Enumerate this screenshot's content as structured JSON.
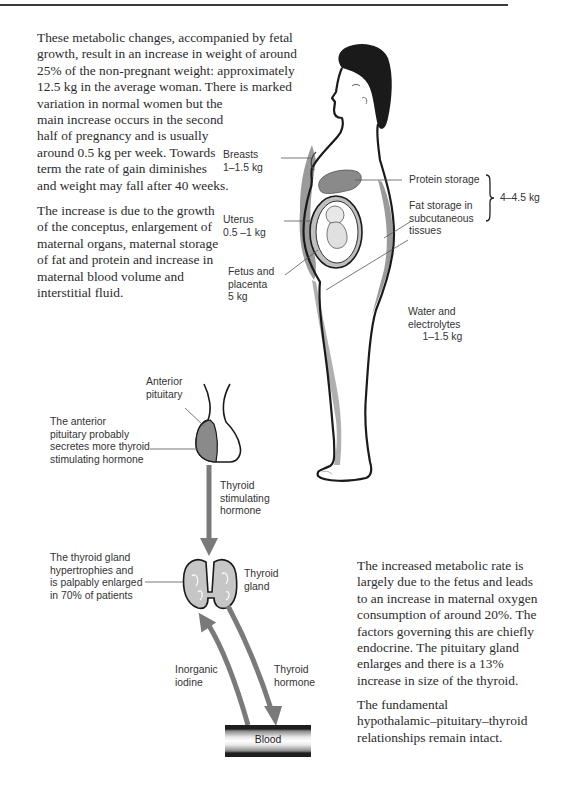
{
  "page": {
    "paragraphs": {
      "intro_1": "These metabolic changes, accompanied by fetal growth, result in an increase in weight of around 25% of the non-pregnant weight: approximately 12.5 kg in the average woman. There is marked variation in normal women but the main increase occurs in the second half of pregnancy and is usually around 0.5 kg per week. Towards term the rate of gain diminishes and weight may fall after 40 weeks.",
      "intro_2": "The increase is due to the growth of the conceptus, enlargement of maternal organs, maternal storage of fat and protein and increase in maternal blood volume and interstitial fluid.",
      "metabolic_1": "The increased metabolic rate is largely due to the fetus and leads to an increase in maternal oxygen consumption of around 20%. The factors governing this are chiefly endocrine. The pituitary gland enlarges and there is a 13% increase in size of the thyroid.",
      "metabolic_2": "The fundamental hypothalamic–pituitary–thyroid relationships remain intact."
    },
    "intro_1_lines": [
      "These metabolic changes, accompanied by fetal",
      "growth, result in an increase in weight of around",
      "25% of the non-pregnant weight: approximately",
      "12.5 kg in the average woman. There is marked",
      "variation in normal women but the",
      "main increase occurs in the second",
      "half of pregnancy and is usually",
      "around 0.5 kg per week. Towards",
      "term the rate of gain diminishes",
      "and weight may fall after 40 weeks."
    ],
    "intro_2_lines": [
      "The increase is due to the growth",
      "of the conceptus, enlargement of",
      "maternal organs, maternal storage",
      "of fat and protein and increase in",
      "maternal blood volume and",
      "interstitial fluid."
    ],
    "metabolic_1_lines": [
      "The increased metabolic rate is",
      "largely due to the fetus and leads",
      "to an increase in maternal oxygen",
      "consumption of around 20%. The",
      "factors governing this are chiefly",
      "endocrine. The pituitary gland",
      "enlarges and there is a 13%",
      "increase in size of the thyroid."
    ],
    "metabolic_2_lines": [
      "The fundamental",
      "hypothalamic–pituitary–thyroid",
      "relationships remain intact."
    ]
  },
  "weight_figure": {
    "labels": {
      "breasts": "Breasts\n1–1.5 kg",
      "protein": "Protein storage",
      "fat": "Fat storage in\nsubcutaneous\ntissues",
      "protein_fat_total": "4–4.5 kg",
      "uterus": "Uterus\n0.5 –1 kg",
      "fetus": "Fetus and\nplacenta\n5 kg",
      "water": "Water and\nelectrolytes\n     1–1.5 kg"
    }
  },
  "thyroid_figure": {
    "labels": {
      "anterior_pituitary": "Anterior\npituitary",
      "pituitary_note": "The anterior\npituitary probably\nsecretes more thyroid\nstimulating hormone",
      "tsh": "Thyroid\nstimulating\nhormone",
      "thyroid_note": "The thyroid gland\nhypertrophies and\nis palpably enlarged\nin 70% of patients",
      "thyroid_gland": "Thyroid\ngland",
      "iodine": "Inorganic\niodine",
      "thyroid_hormone": "Thyroid\nhormone",
      "blood": "Blood"
    }
  },
  "colors": {
    "shading": "#8f8f8f",
    "outline": "#1a1a1a",
    "arrow": "#7a7a7a"
  }
}
